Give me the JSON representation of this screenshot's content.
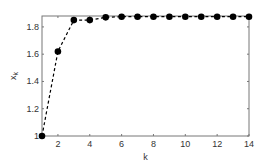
{
  "chart_data": {
    "type": "line",
    "title": "",
    "xlabel": "k",
    "ylabel": "x_k",
    "x": [
      1,
      2,
      3,
      4,
      5,
      6,
      7,
      8,
      9,
      10,
      11,
      12,
      13,
      14
    ],
    "series": [
      {
        "name": "x_k",
        "values": [
          1.0,
          1.62,
          1.85,
          1.85,
          1.87,
          1.875,
          1.875,
          1.875,
          1.875,
          1.875,
          1.875,
          1.875,
          1.875,
          1.875
        ],
        "style": "dashed line with filled circle markers",
        "color": "#000000"
      }
    ],
    "xlim": [
      1,
      14
    ],
    "ylim": [
      1,
      1.88
    ],
    "xticks": [
      2,
      4,
      6,
      8,
      10,
      12,
      14
    ],
    "yticks": [
      1,
      1.2,
      1.4,
      1.6,
      1.8
    ],
    "ytick_labels": [
      "1",
      "1.2",
      "1.4",
      "1.6",
      "1.8"
    ],
    "grid": false,
    "legend": null
  }
}
